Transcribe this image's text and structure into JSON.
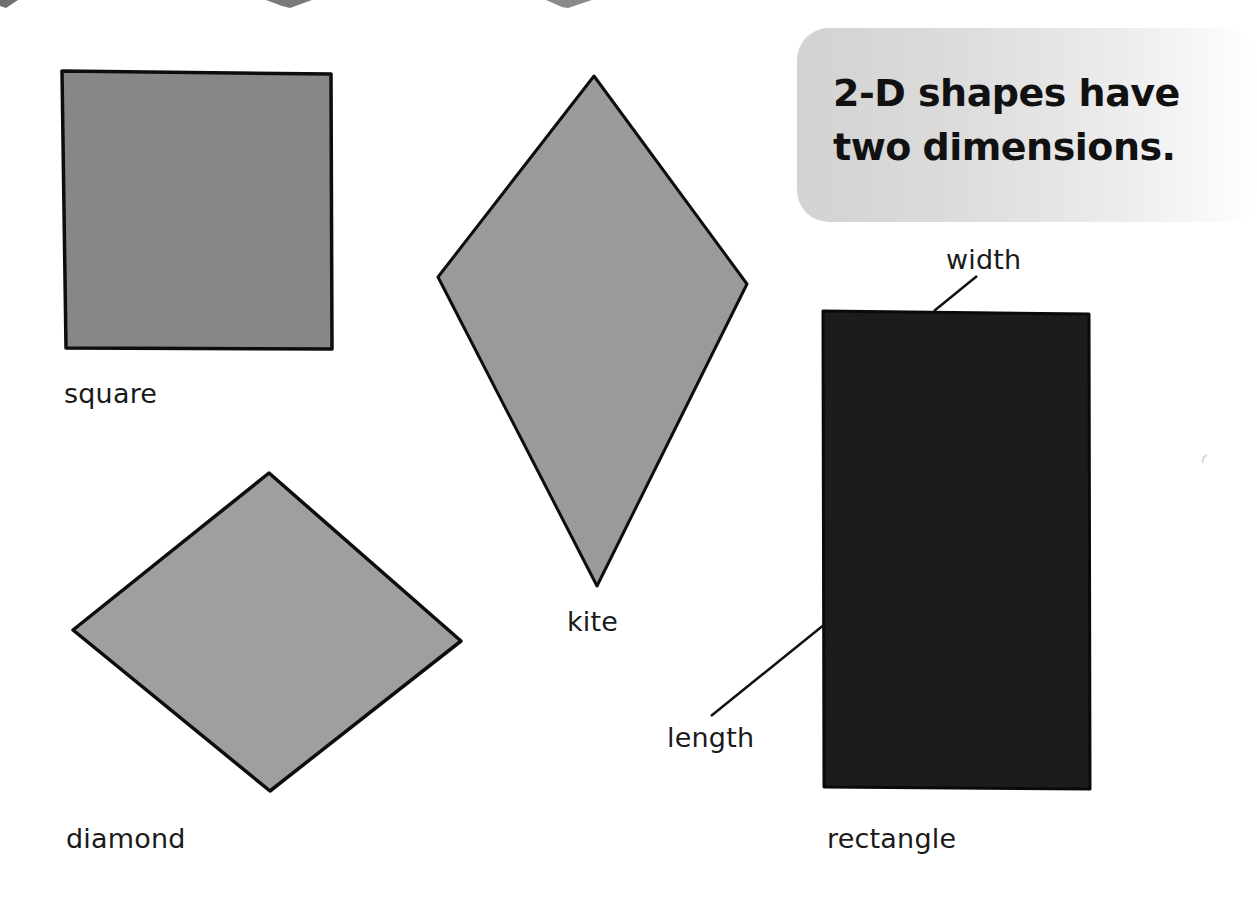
{
  "heading": {
    "line1": "2-D shapes have",
    "line2_normal": "two",
    "line2_bold": "dimensions."
  },
  "shapes": [
    {
      "name": "square",
      "label": "square",
      "fill": "#8a8a8a"
    },
    {
      "name": "kite",
      "label": "kite",
      "fill": "#9d9d9d"
    },
    {
      "name": "diamond",
      "label": "diamond",
      "fill": "#a2a2a2"
    },
    {
      "name": "rectangle",
      "label": "rectangle",
      "fill": "#1e1e1e"
    }
  ],
  "annotations": {
    "width_label": "width",
    "length_label": "length"
  },
  "colors": {
    "outline": "#0d0d0d",
    "title_box_start": "#d2d2d2",
    "title_box_end": "#ffffff",
    "text": "#141414"
  }
}
